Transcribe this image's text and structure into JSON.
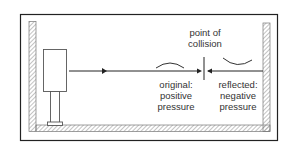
{
  "diagram": {
    "labels": {
      "collision_line1": "point of",
      "collision_line2": "collision",
      "original_line1": "original:",
      "original_line2": "positive",
      "original_line3": "pressure",
      "reflected_line1": "reflected:",
      "reflected_line2": "negative",
      "reflected_line3": "pressure"
    },
    "colors": {
      "line": "#222222",
      "hatch": "#999999",
      "text": "#333333"
    }
  }
}
